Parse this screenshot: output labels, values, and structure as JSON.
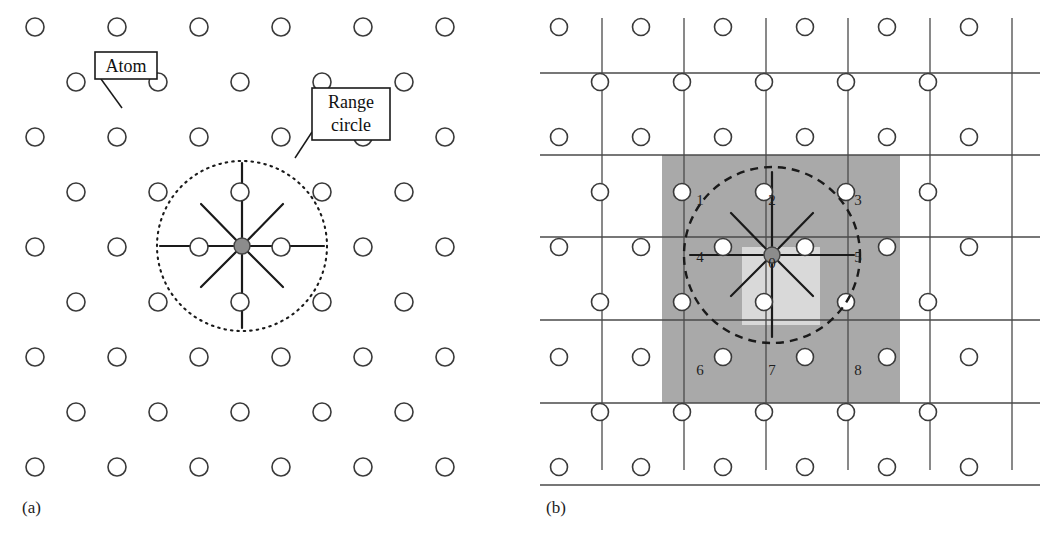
{
  "figure": {
    "type": "diagram",
    "background_color": "#ffffff",
    "width": 1048,
    "height": 548
  },
  "panels": [
    {
      "id": "a",
      "caption": "(a)",
      "caption_x": 22,
      "caption_y": 498,
      "origin_x": 0,
      "origin_y": 0,
      "description": "Staggered atom lattice with a dotted range circle around one central atom; spokes drawn to the 8 neighbors inside the circle."
    },
    {
      "id": "b",
      "caption": "(b)",
      "caption_x": 546,
      "caption_y": 498,
      "origin_x": 524,
      "origin_y": 0,
      "description": "Same lattice overlaid with a uniform grid; the 3x3 block of cells covering the range circle is shaded and numbered 0 through 8."
    }
  ],
  "lattice": {
    "row_spacing": 55,
    "col_spacing": 82,
    "odd_row_offset": 41,
    "first_row_y": 27,
    "row_count": 9,
    "cols_even_row": 6,
    "cols_odd_row": 5,
    "even_row_start_x": 35,
    "odd_row_start_x": 76,
    "atom_radius_a": 9,
    "atom_radius_b": 8.5,
    "atom_fill_open": "#ffffff",
    "atom_stroke": "#3a3a3a",
    "atom_stroke_width": 1.6
  },
  "center_atom": {
    "label": "center-atom",
    "fill": "#8c8c8c",
    "stroke": "#444444",
    "radius": 8,
    "panel_a_x": 242,
    "panel_a_y": 246,
    "panel_b_x": 772,
    "panel_b_y": 255
  },
  "range_circle": {
    "panel_a": {
      "cx": 242,
      "cy": 246,
      "r": 85,
      "style": "dotted",
      "stroke": "#1a1a1a",
      "stroke_width": 2.1,
      "dash": "1.5 5"
    },
    "panel_b": {
      "cx": 772,
      "cy": 255,
      "r": 88,
      "style": "dashed",
      "stroke": "#1a1a1a",
      "stroke_width": 2.4,
      "dash": "8 6"
    }
  },
  "spokes": {
    "count": 8,
    "stroke": "#1a1a1a",
    "stroke_width": 2.2,
    "directions": [
      "up",
      "down",
      "left",
      "right",
      "up-left",
      "up-right",
      "down-left",
      "down-right"
    ],
    "panel_a_neighbors": [
      {
        "dir": "up",
        "x": 242,
        "y": 163
      },
      {
        "dir": "down",
        "x": 242,
        "y": 328
      },
      {
        "dir": "left",
        "x": 160,
        "y": 246
      },
      {
        "dir": "right",
        "x": 324,
        "y": 246
      },
      {
        "dir": "up-left",
        "x": 201,
        "y": 204
      },
      {
        "dir": "up-right",
        "x": 283,
        "y": 204
      },
      {
        "dir": "down-left",
        "x": 201,
        "y": 287
      },
      {
        "dir": "down-right",
        "x": 283,
        "y": 287
      }
    ],
    "panel_b_neighbors": [
      {
        "dir": "up",
        "x": 772,
        "y": 172
      },
      {
        "dir": "down",
        "x": 772,
        "y": 337
      },
      {
        "dir": "left",
        "x": 690,
        "y": 255
      },
      {
        "dir": "right",
        "x": 854,
        "y": 255
      },
      {
        "dir": "up-left",
        "x": 731,
        "y": 213
      },
      {
        "dir": "up-right",
        "x": 813,
        "y": 213
      },
      {
        "dir": "down-left",
        "x": 731,
        "y": 296
      },
      {
        "dir": "down-right",
        "x": 813,
        "y": 296
      }
    ]
  },
  "callouts": [
    {
      "name": "atom",
      "text": "Atom",
      "box": {
        "x": 95,
        "y": 52,
        "w": 62,
        "h": 27
      },
      "font_size": 18,
      "leader": {
        "x1": 101,
        "y1": 79,
        "x2": 122,
        "y2": 108
      },
      "target_atom": {
        "x": 117,
        "y": 109
      }
    },
    {
      "name": "range-circle",
      "lines": [
        "Range",
        "circle"
      ],
      "box": {
        "x": 312,
        "y": 88,
        "w": 78,
        "h": 52
      },
      "font_size": 18,
      "leader": {
        "x1": 312,
        "y1": 132,
        "x2": 295,
        "y2": 158
      },
      "target": "dotted range circle arc"
    }
  ],
  "grid": {
    "stroke": "#4a4a4a",
    "stroke_width": 1.3,
    "vertical_x": [
      602,
      684,
      766,
      848,
      930,
      1012
    ],
    "horizontal_y": [
      73,
      155,
      237,
      320,
      403,
      485
    ],
    "cell_w": 82,
    "cell_h": 82,
    "note": "Uniform bins; vertical lines run the panel height, horizontal lines run the panel width."
  },
  "shaded_block": {
    "x": 662,
    "y": 155,
    "w": 238,
    "h": 248,
    "outer_fill": "#a9a9a9",
    "center_fill": "#d9d9d9",
    "center_cell": {
      "x": 742,
      "y": 247,
      "w": 78,
      "h": 78
    },
    "cell_labels": [
      {
        "id": "1",
        "x": 700,
        "y": 205
      },
      {
        "id": "2",
        "x": 772,
        "y": 205
      },
      {
        "id": "3",
        "x": 858,
        "y": 205
      },
      {
        "id": "4",
        "x": 700,
        "y": 262
      },
      {
        "id": "0",
        "x": 772,
        "y": 268
      },
      {
        "id": "5",
        "x": 858,
        "y": 262
      },
      {
        "id": "6",
        "x": 700,
        "y": 375
      },
      {
        "id": "7",
        "x": 772,
        "y": 375
      },
      {
        "id": "8",
        "x": 858,
        "y": 375
      }
    ],
    "label_font_size": 15,
    "label_color": "#1f1f1f"
  },
  "chart_data": {
    "type": "diagram",
    "panel_a_label": "(a)",
    "panel_b_label": "(b)",
    "annotations": [
      "Atom",
      "Range circle"
    ],
    "cell_numbers": [
      "0",
      "1",
      "2",
      "3",
      "4",
      "5",
      "6",
      "7",
      "8"
    ],
    "neighbor_count": 8,
    "searched_cells": 9
  }
}
